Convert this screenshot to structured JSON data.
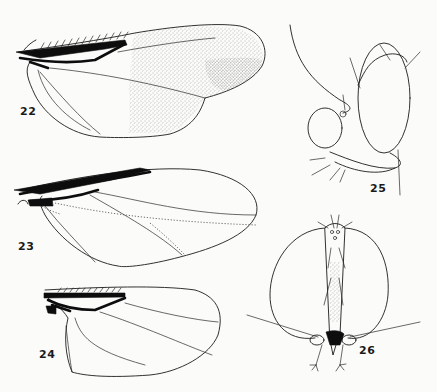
{
  "plate": {
    "background": "#fbfbfa",
    "ink_color": "#1b1b1b",
    "stipple_color": "#8a8a8a",
    "figures": [
      {
        "id": "fig-22",
        "label": "22",
        "subject": "wing",
        "shading": "stippled apical half"
      },
      {
        "id": "fig-23",
        "label": "23",
        "subject": "wing",
        "shading": "none, dotted veins"
      },
      {
        "id": "fig-24",
        "label": "24",
        "subject": "wing",
        "shading": "none"
      },
      {
        "id": "fig-25",
        "label": "25",
        "subject": "head, lateral view"
      },
      {
        "id": "fig-26",
        "label": "26",
        "subject": "head, frontal view"
      }
    ]
  }
}
